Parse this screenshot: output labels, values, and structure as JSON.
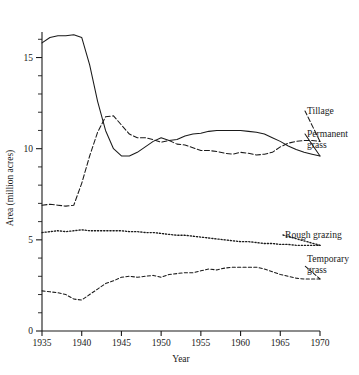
{
  "chart_data": {
    "type": "line",
    "title": "",
    "xlabel": "Year",
    "ylabel": "Area (million acres)",
    "xlim": [
      1935,
      1970
    ],
    "ylim": [
      0,
      16.4
    ],
    "xticks": [
      1935,
      1940,
      1945,
      1950,
      1955,
      1960,
      1965,
      1970
    ],
    "xtick_labels": [
      "1935",
      "1940",
      "1945",
      "1950",
      "1955",
      "1960",
      "1965",
      "1970"
    ],
    "yticks": [
      0,
      5,
      10,
      15
    ],
    "ytick_labels": [
      "0",
      "5",
      "10",
      "15"
    ],
    "y_minor_step": 1,
    "grid": false,
    "legend_position": "right-inline-labels",
    "x": [
      1935,
      1936,
      1937,
      1938,
      1939,
      1940,
      1941,
      1942,
      1943,
      1944,
      1945,
      1946,
      1947,
      1948,
      1949,
      1950,
      1951,
      1952,
      1953,
      1954,
      1955,
      1956,
      1957,
      1958,
      1959,
      1960,
      1961,
      1962,
      1963,
      1964,
      1965,
      1966,
      1967,
      1968,
      1969,
      1970
    ],
    "series": [
      {
        "name": "Permanent grass",
        "style": "solid",
        "values": [
          15.8,
          16.1,
          16.2,
          16.2,
          16.25,
          16.1,
          14.6,
          12.6,
          11.0,
          10.0,
          9.6,
          9.6,
          9.8,
          10.1,
          10.4,
          10.6,
          10.45,
          10.5,
          10.7,
          10.8,
          10.85,
          10.95,
          11.0,
          11.0,
          11.0,
          11.0,
          10.95,
          10.9,
          10.8,
          10.6,
          10.4,
          10.15,
          9.95,
          9.8,
          9.7,
          9.6
        ]
      },
      {
        "name": "Tillage",
        "style": "dashed",
        "values": [
          6.9,
          6.95,
          6.9,
          6.85,
          6.9,
          8.1,
          9.6,
          10.9,
          11.75,
          11.8,
          11.3,
          10.8,
          10.6,
          10.6,
          10.5,
          10.35,
          10.45,
          10.25,
          10.2,
          10.05,
          9.9,
          9.9,
          9.85,
          9.75,
          9.7,
          9.8,
          9.75,
          9.65,
          9.7,
          9.8,
          10.1,
          10.3,
          10.4,
          10.45,
          10.45,
          10.4
        ]
      },
      {
        "name": "Rough grazing",
        "style": "dotted",
        "values": [
          5.4,
          5.45,
          5.5,
          5.45,
          5.5,
          5.55,
          5.5,
          5.5,
          5.5,
          5.5,
          5.5,
          5.45,
          5.45,
          5.4,
          5.4,
          5.35,
          5.3,
          5.25,
          5.25,
          5.2,
          5.15,
          5.1,
          5.05,
          5.0,
          4.95,
          4.9,
          4.9,
          4.85,
          4.8,
          4.8,
          4.75,
          4.75,
          4.7,
          4.7,
          4.7,
          4.7
        ]
      },
      {
        "name": "Temporary grass",
        "style": "dashdot",
        "values": [
          2.2,
          2.15,
          2.1,
          2.0,
          1.75,
          1.7,
          2.0,
          2.3,
          2.6,
          2.75,
          2.95,
          3.0,
          2.95,
          3.0,
          3.05,
          2.95,
          3.1,
          3.15,
          3.2,
          3.2,
          3.3,
          3.4,
          3.35,
          3.45,
          3.5,
          3.5,
          3.5,
          3.5,
          3.4,
          3.25,
          3.1,
          3.0,
          2.9,
          2.85,
          2.85,
          2.85
        ]
      }
    ],
    "annotations": [
      {
        "text": "Tillage",
        "for": "Tillage"
      },
      {
        "text": "Permanent",
        "for": "Permanent grass"
      },
      {
        "text": "grass",
        "for": "Permanent grass"
      },
      {
        "text": "Rough grazing",
        "for": "Rough grazing"
      },
      {
        "text": "Temporary",
        "for": "Temporary grass"
      },
      {
        "text": "grass",
        "for": "Temporary grass"
      }
    ],
    "colors": {
      "ink": "#1a1a1a",
      "background": "#ffffff"
    }
  }
}
